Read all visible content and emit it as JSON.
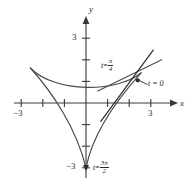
{
  "figure": {
    "kind": "parametric-curve-plot"
  },
  "axes": {
    "x_label": "x",
    "y_label": "y",
    "x_ticks": [
      -3,
      -2,
      -1,
      1,
      2,
      3
    ],
    "y_ticks": [
      3,
      2,
      1,
      -1,
      -2,
      -3
    ],
    "x_tick_labels": {
      "neg3": "−3",
      "pos3": "3"
    },
    "y_tick_labels": {
      "pos3": "3",
      "neg3": "−3"
    },
    "xlim": [
      -3.9,
      4.1
    ],
    "ylim": [
      -3.5,
      3.6
    ],
    "origin_px": {
      "x": 86,
      "y": 103
    },
    "unit_px": 21.6,
    "axis_color": "#3a3a3a"
  },
  "curve": {
    "name": "deltoid",
    "color": "#4a4a4a",
    "cusps": [
      {
        "label": "upper-left",
        "x": -2.6,
        "y": 1.62
      },
      {
        "label": "upper-right",
        "x": 2.55,
        "y": 1.4
      },
      {
        "label": "bottom",
        "x": 0.0,
        "y": -3.0
      }
    ]
  },
  "tangents": [
    {
      "name": "tangent-t-pi-over-4",
      "color": "#4a4a4a",
      "from": {
        "x": -0.09,
        "y": 0.55
      },
      "to": {
        "x": 3.5,
        "y": 2.0
      }
    },
    {
      "name": "tangent-t-0",
      "color": "#2f2f2f",
      "from": {
        "x": 0.6,
        "y": -0.85
      },
      "to": {
        "x": 3.0,
        "y": 2.45
      }
    }
  ],
  "point_markers": [
    {
      "name": "marker-t-0",
      "x": 2.4,
      "y": 1.05
    },
    {
      "name": "marker-bottom-cusp",
      "x": 0.0,
      "y": -3.0
    }
  ],
  "annotations": {
    "t_pi_over_4": {
      "prefix": "t",
      "equals": "=",
      "num": "π",
      "den": "4"
    },
    "t_zero": {
      "text": "t = 0"
    },
    "t_3pi_over_2": {
      "prefix": "t",
      "equals": "=",
      "num": "3π",
      "den": "2"
    }
  }
}
